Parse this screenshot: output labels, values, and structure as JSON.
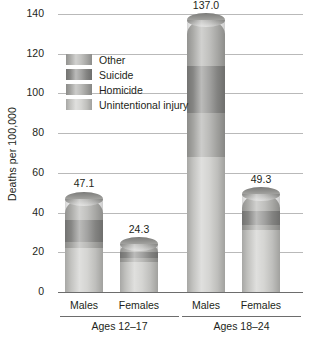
{
  "chart_data": {
    "type": "bar",
    "title": "",
    "subtitle": "",
    "xlabel": "",
    "ylabel": "Deaths per 100,000",
    "ylim": [
      0,
      140
    ],
    "yticks": [
      0,
      20,
      40,
      60,
      80,
      100,
      120,
      140
    ],
    "ytick_labels": [
      "0",
      "20",
      "40",
      "60",
      "80",
      "100",
      "120",
      "140"
    ],
    "grid": true,
    "stacked": true,
    "legend_position": "upper-left-inside",
    "categories": [
      "Males",
      "Females",
      "Males",
      "Females"
    ],
    "groups": [
      {
        "label": "Ages 12–17",
        "categories": [
          "Males",
          "Females"
        ]
      },
      {
        "label": "Ages 18–24",
        "categories": [
          "Males",
          "Females"
        ]
      }
    ],
    "series": [
      {
        "name": "Unintentional injury",
        "color": "#c9c9c6",
        "values": [
          22.1,
          15.0,
          68.0,
          31.0
        ]
      },
      {
        "name": "Homicide",
        "color": "#a8a8a5",
        "values": [
          3.0,
          2.0,
          22.0,
          3.0
        ]
      },
      {
        "name": "Suicide",
        "color": "#8a8a88",
        "values": [
          11.0,
          3.0,
          24.0,
          7.0
        ]
      },
      {
        "name": "Other",
        "color": "#b0b0ad",
        "values": [
          11.0,
          4.3,
          23.0,
          8.3
        ]
      }
    ],
    "totals": [
      47.1,
      24.3,
      137.0,
      49.3
    ],
    "total_labels": [
      "47.1",
      "24.3",
      "137.0",
      "49.3"
    ],
    "annotations": []
  },
  "legend": {
    "items": [
      {
        "label": "Other",
        "color": "#b0b0ad"
      },
      {
        "label": "Suicide",
        "color": "#8a8a88"
      },
      {
        "label": "Homicide",
        "color": "#a8a8a5"
      },
      {
        "label": "Unintentional injury",
        "color": "#c9c9c6"
      }
    ]
  },
  "colors": {
    "gridline": "#b9b9b9",
    "axis": "#6d6d6d",
    "text": "#231f20",
    "background": "#ffffff"
  }
}
